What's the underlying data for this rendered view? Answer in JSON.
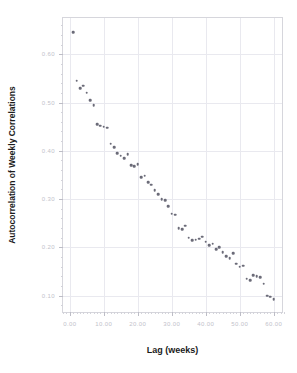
{
  "top_strip": {
    "clipped_text": "",
    "note": "faint clipped text row at very top of screenshot"
  },
  "chart_data": {
    "type": "scatter",
    "title": "",
    "xlabel": "Lag (weeks)",
    "ylabel": "Autocorrelation of Weekly Correlations",
    "xlim": [
      -2.0,
      63.0
    ],
    "ylim": [
      0.062,
      0.675
    ],
    "grid": true,
    "legend": null,
    "xticks": [
      0,
      10,
      20,
      30,
      40,
      50,
      60
    ],
    "xticklabels": [
      "0.00",
      "10.00",
      "20.00",
      "30.00",
      "40.00",
      "50.00",
      "60.00"
    ],
    "yticks": [
      0.1,
      0.2,
      0.3,
      0.4,
      0.5,
      0.6
    ],
    "yticklabels": [
      "0.10",
      "0.20",
      "0.30",
      "0.40",
      "0.50",
      "0.60"
    ],
    "marker": "circle",
    "marker_color": "#6b6b78",
    "x": [
      1,
      2,
      3,
      4,
      5,
      6,
      7,
      8,
      9,
      10,
      11,
      12,
      13,
      14,
      15,
      16,
      17,
      18,
      19,
      20,
      21,
      22,
      23,
      24,
      25,
      26,
      27,
      28,
      29,
      30,
      31,
      32,
      33,
      34,
      35,
      36,
      37,
      38,
      39,
      40,
      41,
      42,
      43,
      44,
      45,
      46,
      47,
      48,
      49,
      50,
      51,
      52,
      53,
      54,
      55,
      56,
      57,
      58,
      59,
      60
    ],
    "y": [
      0.645,
      0.545,
      0.53,
      0.535,
      0.52,
      0.505,
      0.495,
      0.455,
      0.452,
      0.45,
      0.448,
      0.415,
      0.408,
      0.395,
      0.39,
      0.385,
      0.393,
      0.37,
      0.368,
      0.372,
      0.345,
      0.348,
      0.335,
      0.33,
      0.318,
      0.31,
      0.3,
      0.298,
      0.285,
      0.27,
      0.268,
      0.24,
      0.238,
      0.245,
      0.22,
      0.215,
      0.216,
      0.218,
      0.222,
      0.212,
      0.205,
      0.208,
      0.196,
      0.2,
      0.19,
      0.182,
      0.178,
      0.188,
      0.166,
      0.16,
      0.162,
      0.135,
      0.132,
      0.142,
      0.14,
      0.138,
      0.125,
      0.1,
      0.098,
      0.093
    ]
  }
}
